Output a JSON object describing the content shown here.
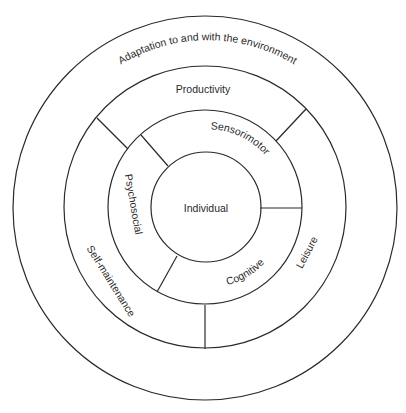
{
  "diagram": {
    "title": "",
    "center": {
      "x": 205,
      "y": 207
    },
    "rings": [
      {
        "name": "individual",
        "radius": 55
      },
      {
        "name": "performance-components",
        "radius": 97
      },
      {
        "name": "occupations",
        "radius": 141
      },
      {
        "name": "environment",
        "radius": 191
      }
    ],
    "labels": {
      "individual": "Individual",
      "sensorimotor": "Sensorimotor",
      "psychosocial": "Psychosocial",
      "cognitive": "Cognitive",
      "productivity": "Productivity",
      "self_maintenance": "Self-maintenance",
      "leisure": "Leisure",
      "environment": "Adaptation to and with the environment"
    },
    "inner_segments": [
      "Sensorimotor",
      "Psychosocial",
      "Cognitive"
    ],
    "middle_segments": [
      "Productivity",
      "Self-maintenance",
      "Leisure"
    ],
    "outer_layer": "Adaptation to and with the environment",
    "colors": {
      "stroke": "#2a2a2a",
      "text": "#2a2a2a",
      "background": "#ffffff"
    }
  }
}
